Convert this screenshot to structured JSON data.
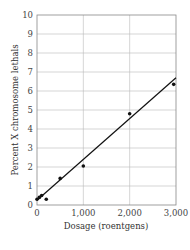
{
  "chart_data": {
    "type": "scatter",
    "title": "",
    "xlabel": "Dosage (roentgens)",
    "ylabel": "Percent X chromosome lethals",
    "xlim": [
      0,
      3000
    ],
    "ylim": [
      0,
      10
    ],
    "x_ticks": [
      "0",
      "1,000",
      "2,000",
      "3,000"
    ],
    "y_ticks": [
      "0",
      "1",
      "2",
      "3",
      "4",
      "5",
      "6",
      "7",
      "8",
      "9",
      "10"
    ],
    "grid": true,
    "legend": null,
    "series": [
      {
        "name": "observed",
        "type": "scatter",
        "x": [
          0,
          50,
          100,
          200,
          500,
          1000,
          2000,
          2950
        ],
        "y": [
          0.3,
          0.4,
          0.5,
          0.3,
          1.4,
          2.05,
          4.8,
          6.35
        ]
      },
      {
        "name": "linear fit",
        "type": "line",
        "x": [
          0,
          3000
        ],
        "y": [
          0.25,
          6.7
        ]
      }
    ]
  }
}
